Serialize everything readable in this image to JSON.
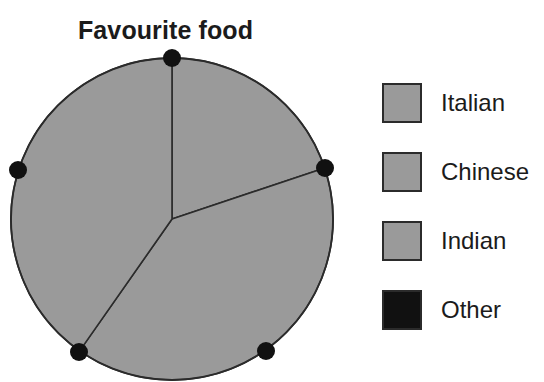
{
  "chart_data": {
    "type": "pie",
    "title": "Favourite food",
    "categories": [
      "Italian",
      "Chinese",
      "Indian",
      "Other"
    ],
    "values": [
      20,
      40,
      40,
      0
    ],
    "units": "percent",
    "sector_angles_deg": [
      71.5,
      143.5,
      145.0,
      0
    ],
    "colors": [
      "#9a9a9a",
      "#9a9a9a",
      "#9a9a9a",
      "#111111"
    ],
    "edge_color": "#2b2b2b",
    "legend_position": "right",
    "grid": false,
    "xlabel": "",
    "ylabel": "",
    "geometry": {
      "center_x": 172,
      "center_y": 179,
      "radius": 161,
      "start_angle_deg": 0,
      "direction": "clockwise"
    },
    "boundary_markers": [
      {
        "name": "marker-top",
        "x": 172,
        "y": 18,
        "angle_deg": 0
      },
      {
        "name": "marker-right",
        "x": 325,
        "y": 128,
        "angle_deg": 71.5
      },
      {
        "name": "marker-bottom-right",
        "x": 266,
        "y": 311,
        "angle_deg": 144
      },
      {
        "name": "marker-bottom-left",
        "x": 79,
        "y": 312,
        "angle_deg": 215
      },
      {
        "name": "marker-left",
        "x": 18,
        "y": 130,
        "angle_deg": 288
      }
    ],
    "annotations": []
  },
  "title": {
    "text": "Favourite food"
  },
  "legend": {
    "items": [
      {
        "label": "Italian",
        "color": "#9a9a9a",
        "swatch_name": "legend-swatch-italian"
      },
      {
        "label": "Chinese",
        "color": "#9a9a9a",
        "swatch_name": "legend-swatch-chinese"
      },
      {
        "label": "Indian",
        "color": "#9a9a9a",
        "swatch_name": "legend-swatch-indian"
      },
      {
        "label": "Other",
        "color": "#111111",
        "swatch_name": "legend-swatch-other"
      }
    ]
  }
}
